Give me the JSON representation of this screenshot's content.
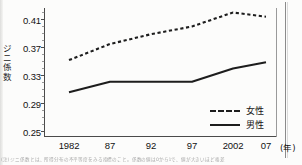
{
  "chart_data": {
    "type": "line",
    "title": "",
    "xlabel": "(年)",
    "ylabel": "ジニ係数",
    "categories": [
      "1982",
      "87",
      "92",
      "97",
      "2002",
      "07"
    ],
    "x_tick_labels": [
      "1982",
      "87",
      "92",
      "97",
      "2002",
      "07"
    ],
    "x_unit_label": "(年)",
    "y_tick_labels": [
      "0.41",
      "0.37",
      "0.33",
      "0.29",
      "0.25"
    ],
    "y_ticks": [
      0.41,
      0.37,
      0.33,
      0.29,
      0.25
    ],
    "ylim": [
      0.25,
      0.43
    ],
    "y_minor_tick_step": 0.01,
    "grid": false,
    "legend_position": "bottom-right",
    "series": [
      {
        "name": "女性",
        "style": "dashed",
        "color": "#1d1d1d",
        "values": [
          0.352,
          0.375,
          0.389,
          0.4,
          0.42,
          0.414
        ]
      },
      {
        "name": "男性",
        "style": "solid",
        "color": "#1d1d1d",
        "values": [
          0.306,
          0.321,
          0.321,
          0.321,
          0.34,
          0.349
        ]
      }
    ]
  },
  "legend": {
    "entries": [
      {
        "label": "女性",
        "style": "dashed"
      },
      {
        "label": "男性",
        "style": "solid"
      }
    ]
  },
  "axis": {
    "y_label_chars": [
      "ジ",
      "ニ",
      "係",
      "数"
    ],
    "y_labels": [
      "0.41",
      "0.37",
      "0.33",
      "0.29",
      "0.25"
    ],
    "x_labels": [
      "1982",
      "87",
      "92",
      "97",
      "2002",
      "07"
    ],
    "x_unit": "(年)"
  },
  "footnote": {
    "text": "(注) ジニ係数とは、所得分布の不平等度をみる指標のこと。係数の値は0から1で、値が大きいほど格差"
  },
  "colors": {
    "line": "#1d1d1d",
    "axis": "#4a4a4a",
    "text": "#121212",
    "page": "#fcfcfb"
  }
}
